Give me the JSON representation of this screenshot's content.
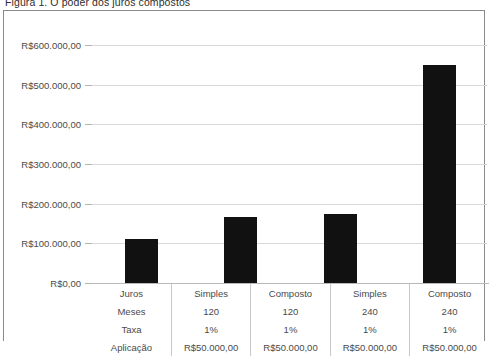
{
  "figure": {
    "caption": "Figura 1. O poder dos juros compostos"
  },
  "chart_data": {
    "type": "bar",
    "title": "Figura 1. O poder dos juros compostos",
    "xlabel": "",
    "ylabel": "",
    "ylim": [
      0,
      600000
    ],
    "grid": true,
    "legend": "none",
    "categories": [
      "Simples 120",
      "Composto 120",
      "Simples 240",
      "Composto 240"
    ],
    "values": [
      110000,
      167000,
      174000,
      550000
    ],
    "ytick_labels": [
      "R$600.000,00",
      "R$500.000,00",
      "R$400.000,00",
      "R$300.000,00",
      "R$200.000,00",
      "R$100.000,00",
      "R$0,00"
    ],
    "ytick_values": [
      600000,
      500000,
      400000,
      300000,
      200000,
      100000,
      0
    ],
    "bar_color": "#111111"
  },
  "table": {
    "rows": [
      {
        "label": "Juros",
        "values": [
          "Simples",
          "Composto",
          "Simples",
          "Composto"
        ]
      },
      {
        "label": "Meses",
        "values": [
          "120",
          "120",
          "240",
          "240"
        ]
      },
      {
        "label": "Taxa",
        "values": [
          "1%",
          "1%",
          "1%",
          "1%"
        ]
      },
      {
        "label": "Aplicação",
        "values": [
          "R$50.000,00",
          "R$50.000,00",
          "R$50.000,00",
          "R$50.000,00"
        ]
      }
    ]
  }
}
